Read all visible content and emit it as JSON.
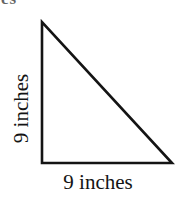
{
  "figure": {
    "type": "right-triangle",
    "clipped_top_text": "es",
    "vertical_side_label": "9 inches",
    "base_side_label": "9 inches",
    "stroke_color": "#141414",
    "background_color": "#ffffff",
    "geometry": {
      "apex": [
        42,
        22
      ],
      "right_angle_vertex": [
        42,
        163
      ],
      "base_right_vertex": [
        172,
        163
      ],
      "vertical_leg_length": "9 inches",
      "horizontal_leg_length": "9 inches",
      "right_angle_at": "bottom-left"
    }
  }
}
